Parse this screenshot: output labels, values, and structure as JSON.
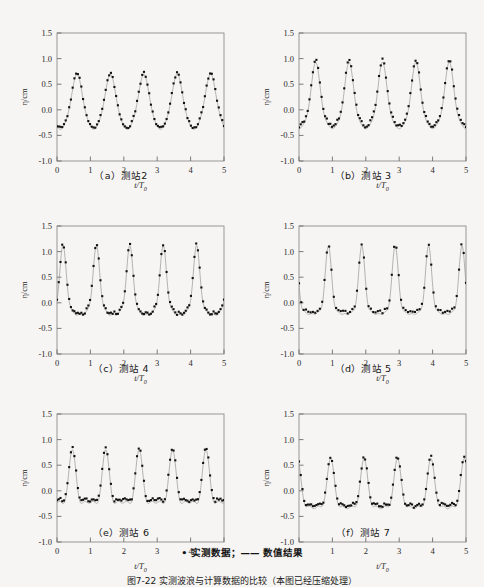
{
  "figure": {
    "legend": "• 实测数据；—— 数值结果",
    "caption": "图7-22  实测波浪与计算数据的比较（本图已经压缩处理）",
    "background": "#f6f5f3",
    "marker_color": "#111111",
    "line_color": "#9a9a9a"
  },
  "axes": {
    "xlabel": "t/T",
    "xlabel_sub": "0",
    "ylabel": "η/cm",
    "xticks": [
      "0",
      "1",
      "2",
      "3",
      "4",
      "5"
    ],
    "yticks": [
      "-1.0",
      "-0.5",
      "0.0",
      "0.5",
      "1.0",
      "1.5"
    ],
    "xlim": [
      0,
      5
    ],
    "ylim": [
      -1.0,
      1.5
    ]
  },
  "panels": [
    {
      "id": "a",
      "caption": "（a）测站2",
      "station": "测站2"
    },
    {
      "id": "b",
      "caption": "（b）测站 3",
      "station": "测站3"
    },
    {
      "id": "c",
      "caption": "（c）测站 4",
      "station": "测站4"
    },
    {
      "id": "d",
      "caption": "（d）测站 5",
      "station": "测站5"
    },
    {
      "id": "e",
      "caption": "（e）测站 6",
      "station": "测站6"
    },
    {
      "id": "f",
      "caption": "（f）测站 7",
      "station": "测站7"
    }
  ],
  "chart_data": [
    {
      "type": "line",
      "panel": "a",
      "title": "（a）测站2",
      "xlabel": "t/T0",
      "ylabel": "η/cm",
      "xlim": [
        0,
        5
      ],
      "ylim": [
        -1.0,
        1.5
      ],
      "grid": false,
      "legend_position": "below-figure",
      "series": [
        {
          "name": "数值结果",
          "style": "line",
          "waveform": {
            "period": 1.0,
            "phase": 0.6,
            "harmonics": [
              {
                "amp": 0.52,
                "k": 1,
                "phase": 0.0
              },
              {
                "amp": 0.09,
                "k": 2,
                "phase": 1.25
              },
              {
                "amp": 0.02,
                "k": 3,
                "phase": 0.4
              }
            ],
            "offset": 0.07,
            "peak": 0.65,
            "trough": -0.46
          }
        },
        {
          "name": "实测数据",
          "style": "points",
          "n_points": 96,
          "offset_y": 0.02
        }
      ]
    },
    {
      "type": "line",
      "panel": "b",
      "title": "（b）测站 3",
      "xlabel": "t/T0",
      "ylabel": "η/cm",
      "xlim": [
        0,
        5
      ],
      "ylim": [
        -1.0,
        1.5
      ],
      "grid": false,
      "series": [
        {
          "name": "数值结果",
          "style": "line",
          "waveform": {
            "period": 1.0,
            "phase": 0.5,
            "harmonics": [
              {
                "amp": 0.6,
                "k": 1,
                "phase": 0.0
              },
              {
                "amp": 0.18,
                "k": 2,
                "phase": 1.3
              },
              {
                "amp": 0.05,
                "k": 3,
                "phase": 0.6
              }
            ],
            "offset": 0.1,
            "peak": 0.8,
            "trough": -0.52
          }
        },
        {
          "name": "实测数据",
          "style": "points",
          "n_points": 96,
          "offset_y": 0.05
        }
      ]
    },
    {
      "type": "line",
      "panel": "c",
      "title": "（c）测站 4",
      "xlabel": "t/T0",
      "ylabel": "η/cm",
      "xlim": [
        0,
        5
      ],
      "ylim": [
        -1.0,
        1.5
      ],
      "grid": false,
      "series": [
        {
          "name": "数值结果",
          "style": "line",
          "waveform": {
            "period": 1.0,
            "phase": 0.18,
            "harmonics": [
              {
                "amp": 0.55,
                "k": 1,
                "phase": 0.0
              },
              {
                "amp": 0.28,
                "k": 2,
                "phase": 1.45
              },
              {
                "amp": 0.12,
                "k": 3,
                "phase": 2.7
              },
              {
                "amp": 0.05,
                "k": 4,
                "phase": 0.9
              }
            ],
            "offset": 0.12,
            "peak": 0.88,
            "trough": -0.4
          }
        },
        {
          "name": "实测数据",
          "style": "points",
          "n_points": 96,
          "offset_y": 0.03
        }
      ]
    },
    {
      "type": "line",
      "panel": "d",
      "title": "（d）测站 5",
      "xlabel": "t/T0",
      "ylabel": "η/cm",
      "xlim": [
        0,
        5
      ],
      "ylim": [
        -1.0,
        1.5
      ],
      "grid": false,
      "series": [
        {
          "name": "数值结果",
          "style": "line",
          "waveform": {
            "period": 1.0,
            "phase": 0.88,
            "harmonics": [
              {
                "amp": 0.52,
                "k": 1,
                "phase": 0.0
              },
              {
                "amp": 0.3,
                "k": 2,
                "phase": 1.5
              },
              {
                "amp": 0.14,
                "k": 3,
                "phase": 2.9
              },
              {
                "amp": 0.05,
                "k": 4,
                "phase": 1.1
              }
            ],
            "offset": 0.1,
            "peak": 0.9,
            "trough": -0.38
          }
        },
        {
          "name": "实测数据",
          "style": "points",
          "n_points": 72,
          "offset_y": 0.04
        }
      ]
    },
    {
      "type": "line",
      "panel": "e",
      "title": "（e）测站 6",
      "xlabel": "t/T0",
      "ylabel": "η/cm",
      "xlim": [
        0,
        5
      ],
      "ylim": [
        -1.0,
        1.5
      ],
      "grid": false,
      "series": [
        {
          "name": "数值结果",
          "style": "line",
          "waveform": {
            "period": 1.0,
            "phase": 0.46,
            "harmonics": [
              {
                "amp": 0.42,
                "k": 1,
                "phase": 0.0
              },
              {
                "amp": 0.26,
                "k": 2,
                "phase": 1.6
              },
              {
                "amp": 0.1,
                "k": 3,
                "phase": 3.1
              }
            ],
            "offset": 0.02,
            "peak": 0.66,
            "trough": -0.55
          }
        },
        {
          "name": "实测数据",
          "style": "points",
          "n_points": 96,
          "offset_y": 0.05
        }
      ]
    },
    {
      "type": "line",
      "panel": "f",
      "title": "（f）测站 7",
      "xlabel": "t/T0",
      "ylabel": "η/cm",
      "xlim": [
        0,
        5
      ],
      "ylim": [
        -1.0,
        1.5
      ],
      "grid": false,
      "series": [
        {
          "name": "数值结果",
          "style": "line",
          "waveform": {
            "period": 1.0,
            "phase": 0.95,
            "harmonics": [
              {
                "amp": 0.4,
                "k": 1,
                "phase": 0.0
              },
              {
                "amp": 0.22,
                "k": 2,
                "phase": 1.7
              },
              {
                "amp": 0.09,
                "k": 3,
                "phase": 3.3
              }
            ],
            "offset": -0.08,
            "peak": 0.47,
            "trough": -0.66
          }
        },
        {
          "name": "实测数据",
          "style": "points",
          "n_points": 96,
          "offset_y": 0.04
        }
      ]
    }
  ]
}
